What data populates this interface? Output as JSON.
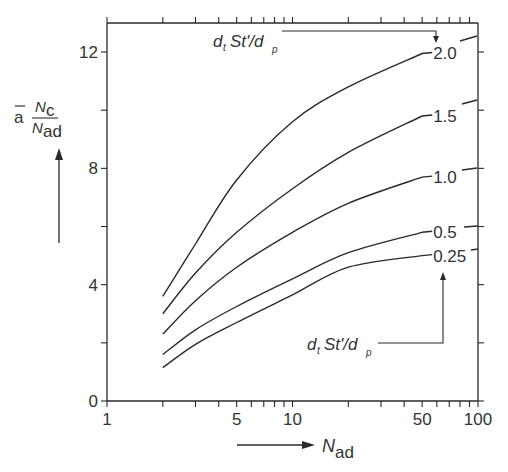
{
  "chart_data": {
    "type": "line",
    "title": "",
    "xlabel": "N_ad",
    "ylabel": "ā · N_c / N_ad",
    "xscale": "log",
    "xlim": [
      1,
      100
    ],
    "ylim": [
      0,
      13
    ],
    "x_ticks": [
      1,
      5,
      10,
      50,
      100
    ],
    "x_tick_labels": [
      "1",
      "5",
      "10",
      "50",
      "100"
    ],
    "y_ticks": [
      0,
      4,
      8,
      12
    ],
    "y_tick_labels": [
      "0",
      "4",
      "8",
      "12"
    ],
    "y_minor_ticks": [
      2,
      6,
      10
    ],
    "grid": false,
    "legend_title": "dₜSt'/dₚ",
    "x": [
      2,
      3,
      5,
      10,
      20,
      50
    ],
    "series": [
      {
        "name": "2.0",
        "label": "2.0",
        "values": [
          3.6,
          5.4,
          7.6,
          9.6,
          10.8,
          11.95
        ]
      },
      {
        "name": "1.5",
        "label": "1.5",
        "values": [
          3.0,
          4.4,
          5.8,
          7.3,
          8.55,
          9.8
        ]
      },
      {
        "name": "1.0",
        "label": "1.0",
        "values": [
          2.3,
          3.45,
          4.6,
          5.8,
          6.8,
          7.7
        ]
      },
      {
        "name": "0.5",
        "label": "0.5",
        "values": [
          1.6,
          2.45,
          3.25,
          4.2,
          5.1,
          5.8
        ]
      },
      {
        "name": "0.25",
        "label": "0.25",
        "values": [
          1.15,
          1.95,
          2.7,
          3.65,
          4.6,
          5.0
        ]
      }
    ],
    "annotations": [
      {
        "text": "dₜSt'/dₚ",
        "position": "top",
        "arrow_to": "2.0"
      },
      {
        "text": "dₜSt'/dₚ",
        "position": "bottom-right",
        "arrow_to": "0.25"
      }
    ]
  },
  "axes": {
    "x_title_main": "N",
    "x_title_sub": "ad",
    "y_title_bar": "a",
    "y_title_num_main": "N",
    "y_title_num_sub": "c",
    "y_title_den_main": "N",
    "y_title_den_sub": "ad"
  },
  "annotation": {
    "d": "d",
    "t": "t",
    "st": "St'/d",
    "p": "p"
  }
}
